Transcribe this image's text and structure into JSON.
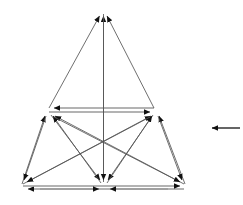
{
  "canvas": {
    "width": 243,
    "height": 205,
    "background": "#ffffff"
  },
  "diagram": {
    "node_count": 6,
    "edge_color": "#555555",
    "rail_color": "#9a9a9a",
    "arrow_color": "#111111",
    "line_width": 0.8,
    "rail_width": 1.6
  },
  "nodes": [
    {
      "id": "apex",
      "label": "",
      "x": 103,
      "y": 10
    },
    {
      "id": "mid-left",
      "label": "",
      "x": 48,
      "y": 110
    },
    {
      "id": "mid-right",
      "label": "",
      "x": 155,
      "y": 110
    },
    {
      "id": "bottom-left",
      "label": "",
      "x": 22,
      "y": 186
    },
    {
      "id": "bottom-middle",
      "label": "",
      "x": 104,
      "y": 186
    },
    {
      "id": "bottom-right",
      "label": "",
      "x": 185,
      "y": 186
    },
    {
      "id": "center-cross",
      "label": "",
      "x": 103,
      "y": 142
    }
  ],
  "edges": [
    {
      "from": "mid-left",
      "to": "apex",
      "style": "thin"
    },
    {
      "from": "mid-right",
      "to": "apex",
      "style": "thin"
    },
    {
      "from": "bottom-middle",
      "to": "apex",
      "style": "thin"
    },
    {
      "from": "bottom-left",
      "to": "mid-left",
      "style": "thin"
    },
    {
      "from": "bottom-middle",
      "to": "mid-left",
      "style": "thin"
    },
    {
      "from": "bottom-right",
      "to": "mid-left",
      "style": "thin"
    },
    {
      "from": "bottom-left",
      "to": "mid-right",
      "style": "thin"
    },
    {
      "from": "bottom-middle",
      "to": "mid-right",
      "style": "thin"
    },
    {
      "from": "bottom-right",
      "to": "mid-right",
      "style": "thin"
    },
    {
      "from": "mid-left",
      "to": "bottom-left",
      "style": "thin"
    },
    {
      "from": "mid-right",
      "to": "bottom-right",
      "style": "thin"
    },
    {
      "from": "mid-left",
      "to": "bottom-middle",
      "style": "thin"
    },
    {
      "from": "mid-right",
      "to": "bottom-middle",
      "style": "thin"
    },
    {
      "from": "mid-right",
      "to": "mid-left",
      "style": "rail"
    },
    {
      "from": "mid-left",
      "to": "mid-right",
      "style": "rail"
    },
    {
      "from": "bottom-right",
      "to": "bottom-left",
      "style": "rail"
    },
    {
      "from": "bottom-left",
      "to": "bottom-right",
      "style": "rail"
    },
    {
      "from": "bottom-middle",
      "to": "bottom-left",
      "style": "rail-left"
    },
    {
      "from": "bottom-middle",
      "to": "bottom-right",
      "style": "rail-right"
    }
  ],
  "standalone_arrow": {
    "name": "left-pointing-arrow",
    "direction": "left",
    "x_start": 240,
    "x_end": 206,
    "y": 128,
    "color": "#111111"
  }
}
